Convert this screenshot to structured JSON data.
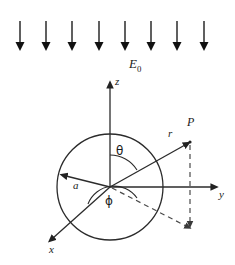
{
  "figure": {
    "background_color": "#ffffff",
    "stroke_color": "#2b2b2b",
    "dash_color": "#555555",
    "width": 235,
    "height": 265
  },
  "field": {
    "label": "E",
    "label_subscript": "0",
    "arrow_count": 8,
    "direction": "down",
    "arrow_x_positions": [
      20,
      46,
      72,
      99,
      125,
      151,
      177,
      204
    ],
    "arrow_y_top": 21,
    "arrow_y_bottom": 50,
    "label_position": {
      "x": 131,
      "y": 62
    }
  },
  "sphere": {
    "center": {
      "x": 110,
      "y": 187
    },
    "radius": 53,
    "radius_label": "a",
    "radius_label_position": {
      "x": 75,
      "y": 183
    },
    "radius_arrow_tip": {
      "x": 61,
      "y": 173
    }
  },
  "axes": [
    {
      "name": "z",
      "label": "z",
      "label_position": {
        "x": 116,
        "y": 78
      },
      "tip": {
        "x": 110,
        "y": 81
      },
      "origin": {
        "x": 110,
        "y": 187
      }
    },
    {
      "name": "y",
      "label": "y",
      "label_position": {
        "x": 220,
        "y": 189
      },
      "tip": {
        "x": 218,
        "y": 187
      },
      "origin": {
        "x": 110,
        "y": 187
      }
    },
    {
      "name": "x",
      "label": "x",
      "label_position": {
        "x": 50,
        "y": 245
      },
      "tip": {
        "x": 48,
        "y": 242
      },
      "origin": {
        "x": 110,
        "y": 187
      }
    }
  ],
  "point": {
    "label": "P",
    "label_position": {
      "x": 190,
      "y": 122
    },
    "position": {
      "x": 190,
      "y": 142
    }
  },
  "radial_vector": {
    "label": "r",
    "label_position": {
      "x": 170,
      "y": 132
    },
    "from": {
      "x": 110,
      "y": 187
    },
    "to": {
      "x": 190,
      "y": 142
    }
  },
  "angles": [
    {
      "name": "theta",
      "label": "θ",
      "label_position": {
        "x": 118,
        "y": 150
      },
      "between": [
        "z-axis",
        "r-vector"
      ]
    },
    {
      "name": "phi",
      "label": "ϕ",
      "label_position": {
        "x": 108,
        "y": 199
      },
      "between": [
        "x-axis",
        "projection-of-r"
      ]
    }
  ],
  "projection": {
    "from": {
      "x": 110,
      "y": 187
    },
    "foot": {
      "x": 190,
      "y": 228
    },
    "drop_from": {
      "x": 190,
      "y": 144
    },
    "style": "dashed"
  }
}
